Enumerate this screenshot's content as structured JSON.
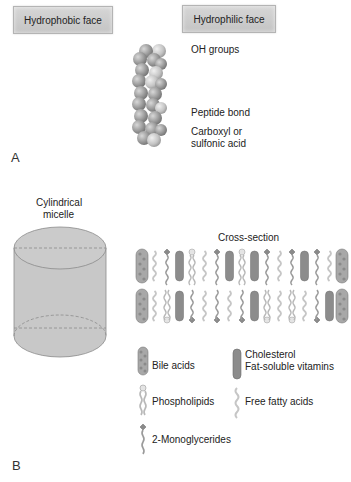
{
  "panel_a": {
    "letter": "A",
    "hydrophobic_label": "Hydrophobic face",
    "hydrophilic_label": "Hydrophilic face",
    "annotations": {
      "oh_groups": "OH groups",
      "peptide_bond": "Peptide bond",
      "carboxyl_line1": "Carboxyl or",
      "carboxyl_line2": "sulfonic acid"
    }
  },
  "panel_b": {
    "letter": "B",
    "cylinder_title_line1": "Cylindrical",
    "cylinder_title_line2": "micelle",
    "cross_section_title": "Cross-section",
    "top_row_sequence": [
      "bile",
      "ffa",
      "mg",
      "chol",
      "pl",
      "ffa",
      "mg",
      "chol",
      "pl",
      "chol",
      "mg",
      "ffa",
      "mg",
      "chol",
      "mg",
      "ffa",
      "bile"
    ],
    "bottom_row_sequence": [
      "bile",
      "ffa",
      "pl",
      "chol",
      "mg",
      "ffa",
      "mg",
      "ffa",
      "mg",
      "chol",
      "pl",
      "ffa",
      "pl",
      "ffa",
      "mg",
      "chol",
      "bile"
    ],
    "legend": {
      "bile_acids": "Bile acids",
      "cholesterol_line1": "Cholesterol",
      "cholesterol_line2": "Fat-soluble vitamins",
      "phospholipids": "Phospholipids",
      "free_fatty_acids": "Free fatty acids",
      "monoglycerides": "2-Monoglycerides"
    }
  },
  "colors": {
    "box_fill": "#cdcdcd",
    "sphere": "#9a9a9a",
    "cylinder_fill": "#c8c8c8",
    "cholesterol": "#8c8c8c",
    "chain": "#b8b8b8"
  }
}
